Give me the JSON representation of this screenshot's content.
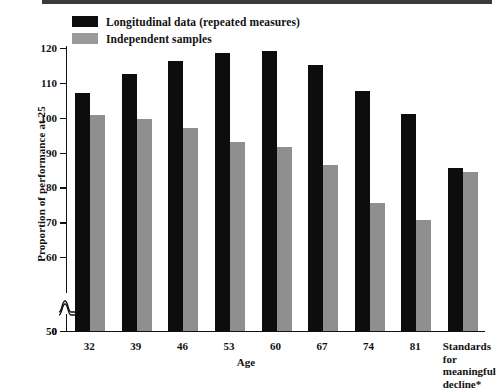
{
  "chart_data": {
    "type": "bar",
    "title": "",
    "xlabel": "Age",
    "ylabel": "Proportion of performance at 25",
    "ylim": [
      0,
      120
    ],
    "y_ticks": [
      0,
      50,
      60,
      70,
      80,
      90,
      100,
      110,
      120
    ],
    "y_axis_break": true,
    "grid": false,
    "legend_position": "top-left",
    "categories": [
      "32",
      "39",
      "46",
      "53",
      "60",
      "67",
      "74",
      "81",
      "Standards for meaningful decline*"
    ],
    "category_labels_multiline": [
      null,
      null,
      null,
      null,
      null,
      null,
      null,
      null,
      [
        "Standards",
        "for",
        "meaningful",
        "decline*"
      ]
    ],
    "series": [
      {
        "name": "Longitudinal data (repeated measures)",
        "color": "#0d0d0d",
        "values": [
          107.2,
          112.6,
          116.4,
          118.5,
          119.1,
          115.2,
          107.6,
          101.0,
          85.5
        ]
      },
      {
        "name": "Independent samples",
        "color": "#8f8f8f",
        "values": [
          100.8,
          99.6,
          97.0,
          93.1,
          91.5,
          86.5,
          75.6,
          70.6,
          84.4
        ]
      }
    ]
  },
  "legend": {
    "items": [
      {
        "label": "Longitudinal data (repeated measures)",
        "swatch": "black"
      },
      {
        "label": "Independent samples",
        "swatch": "gray"
      }
    ]
  },
  "axes": {
    "y_title": "Proportion of performance at 25",
    "x_title": "Age"
  }
}
